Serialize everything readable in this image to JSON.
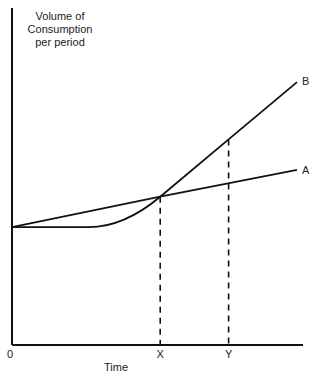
{
  "chart_data": {
    "type": "line",
    "title": "",
    "ylabel_lines": [
      "Volume of",
      "Consumption",
      "per period"
    ],
    "xlabel": "Time",
    "origin_label": "0",
    "x_ticks": [
      {
        "label": "X",
        "x": 0.52
      },
      {
        "label": "Y",
        "x": 0.76
      }
    ],
    "xlim": [
      0,
      1
    ],
    "ylim": [
      0,
      1
    ],
    "series": [
      {
        "name": "A",
        "points": [
          [
            0,
            0.35
          ],
          [
            0.52,
            0.44
          ],
          [
            1.0,
            0.52
          ]
        ]
      },
      {
        "name": "B",
        "points": [
          [
            0,
            0.35
          ],
          [
            0.27,
            0.35
          ],
          [
            0.4,
            0.38
          ],
          [
            0.52,
            0.44
          ],
          [
            0.76,
            0.61
          ],
          [
            1.0,
            0.78
          ]
        ]
      }
    ],
    "dashed_verticals": [
      {
        "at": "X",
        "x": 0.52,
        "top": 0.44
      },
      {
        "at": "Y",
        "x": 0.76,
        "top": 0.61
      }
    ]
  }
}
